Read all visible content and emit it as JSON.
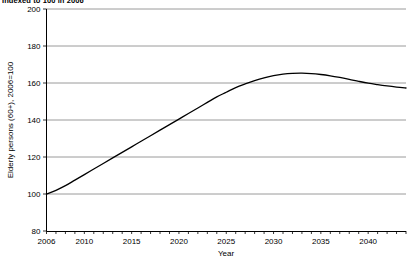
{
  "chart_data": {
    "type": "line",
    "title": "Indexed to 100 in 2006",
    "xlabel": "Year",
    "ylabel": "Elderly persons (60+), 2006=100",
    "xlim": [
      2006,
      2044
    ],
    "ylim": [
      80,
      200
    ],
    "grid": true,
    "legend": "none",
    "ytick_labels": [
      "200",
      "180",
      "160",
      "140",
      "120",
      "100",
      "80"
    ],
    "ytick_values": [
      200,
      180,
      160,
      140,
      120,
      100,
      80
    ],
    "xtick_labels": [
      "2006",
      "2010",
      "2015",
      "2020",
      "2025",
      "2030",
      "2035",
      "2040"
    ],
    "xtick_values": [
      2006,
      2010,
      2015,
      2020,
      2025,
      2030,
      2035,
      2040
    ],
    "minor_xticks_every": 1,
    "series": [
      {
        "name": "Elderly persons (60+), 2006=100",
        "color": "#000000",
        "x": [
          2006,
          2007,
          2008,
          2009,
          2010,
          2011,
          2012,
          2013,
          2014,
          2015,
          2016,
          2017,
          2018,
          2019,
          2020,
          2021,
          2022,
          2023,
          2024,
          2025,
          2026,
          2027,
          2028,
          2029,
          2030,
          2031,
          2032,
          2033,
          2034,
          2035,
          2036,
          2037,
          2038,
          2039,
          2040,
          2041,
          2042,
          2043,
          2044
        ],
        "values": [
          100.0,
          102.0,
          104.5,
          107.5,
          110.5,
          113.5,
          116.5,
          119.5,
          122.5,
          125.5,
          128.5,
          131.5,
          134.5,
          137.5,
          140.5,
          143.5,
          146.5,
          149.5,
          152.5,
          155.0,
          157.5,
          159.5,
          161.3,
          162.8,
          164.0,
          164.8,
          165.2,
          165.3,
          165.1,
          164.6,
          163.9,
          163.0,
          162.0,
          160.9,
          159.9,
          159.1,
          158.4,
          157.8,
          157.3
        ]
      }
    ]
  },
  "axis": {
    "x_title": "Year",
    "y_title": "Elderly persons (60+), 2006=100"
  }
}
